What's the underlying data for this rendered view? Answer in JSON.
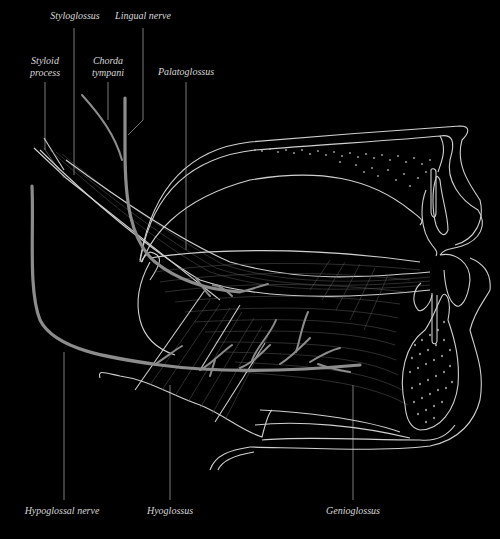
{
  "diagram": {
    "background_color": "#000000",
    "line_color": "#cfcfcf",
    "nerve_color": "#8c8c8c",
    "label_color": "#d8d8d8"
  },
  "labels": {
    "styloglossus": "Styloglossus",
    "lingual_nerve": "Lingual nerve",
    "styloid_process_line1": "Styloid",
    "styloid_process_line2": "process",
    "chorda_tympani_line1": "Chorda",
    "chorda_tympani_line2": "tympani",
    "palatoglossus": "Palatoglossus",
    "hypoglossal_nerve": "Hypoglossal nerve",
    "hyoglossus": "Hyoglossus",
    "genioglossus": "Genioglossus"
  }
}
